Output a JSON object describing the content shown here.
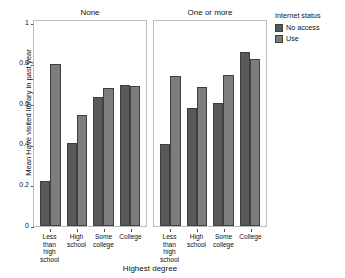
{
  "chart_data": {
    "type": "bar",
    "title": "",
    "xlabel": "Highest degree",
    "ylabel": "Mean Have visited library in past year",
    "ylim": [
      0,
      1
    ],
    "yticks": [
      0,
      0.2,
      0.4,
      0.6,
      0.8,
      1
    ],
    "ytick_labels": [
      "0",
      "0.2",
      "0.4",
      "0.6",
      "0.8",
      "1"
    ],
    "grid": false,
    "legend": {
      "title": "Internet status",
      "position": "right",
      "entries": [
        {
          "label": "No access",
          "color": "#595959"
        },
        {
          "label": "Use",
          "color": "#7d7d7d"
        }
      ]
    },
    "facet_variable": "Number of children",
    "categories": [
      "Less than high school",
      "High school",
      "Some college",
      "College"
    ],
    "panels": [
      {
        "label": "None",
        "series": [
          {
            "name": "No access",
            "values": [
              0.218,
              0.403,
              0.63,
              0.687
            ]
          },
          {
            "name": "Use",
            "values": [
              0.789,
              0.54,
              0.672,
              0.684
            ]
          }
        ]
      },
      {
        "label": "One or more",
        "series": [
          {
            "name": "No access",
            "values": [
              0.399,
              0.577,
              0.598,
              0.85
            ]
          },
          {
            "name": "Use",
            "values": [
              0.733,
              0.677,
              0.739,
              0.814
            ]
          }
        ]
      }
    ]
  }
}
